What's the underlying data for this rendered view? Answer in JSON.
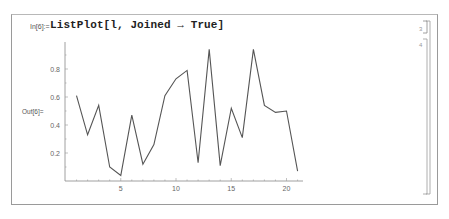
{
  "notebook": {
    "input_label": "In[6]:=",
    "input_code": "ListPlot[l, Joined → True]",
    "output_label": "Out[6]="
  },
  "chart_data": {
    "type": "line",
    "title": "",
    "xlabel": "",
    "ylabel": "",
    "x": [
      1,
      2,
      3,
      4,
      5,
      6,
      7,
      8,
      9,
      10,
      11,
      12,
      13,
      14,
      15,
      16,
      17,
      18,
      19,
      20,
      21
    ],
    "values": [
      0.61,
      0.33,
      0.54,
      0.1,
      0.04,
      0.47,
      0.12,
      0.26,
      0.61,
      0.73,
      0.79,
      0.13,
      0.94,
      0.11,
      0.52,
      0.31,
      0.94,
      0.54,
      0.49,
      0.5,
      0.07
    ],
    "x_ticks": [
      "5",
      "10",
      "15",
      "20"
    ],
    "y_ticks": [
      "0.2",
      "0.4",
      "0.6",
      "0.8"
    ],
    "xlim": [
      0,
      21.5
    ],
    "ylim": [
      0,
      1
    ],
    "grid": false,
    "line_color": "#555555"
  }
}
